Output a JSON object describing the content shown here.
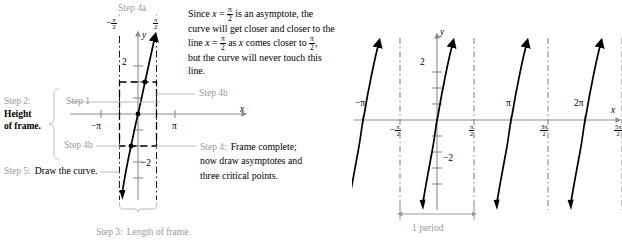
{
  "figure": {
    "kind": "tangent-graphing-steps",
    "colors": {
      "step_label_grey": "#9a9a9a",
      "curve_black": "#000000",
      "axis_grey": "#8c8c8c",
      "frame_dashed": "#000000"
    }
  },
  "steps": {
    "step1": "Step 1",
    "step2_line1": "Step 2:",
    "step2_line2": "Height",
    "step2_line3": "of frame.",
    "step3": "Step 3:",
    "step3_text": "Length of frame.",
    "step4a": "Step 4a",
    "step4b": "Step 4b",
    "step4b_lower": "Step 4b",
    "step4": "Step 4:",
    "step4_text_line1": "Frame complete;",
    "step4_text_line2": "now draw asymptotes and",
    "step4_text_line3": "three critical points.",
    "step5": "Step 5:",
    "step5_text": "Draw the curve."
  },
  "note": {
    "line1_a": "Since ",
    "line1_b": "x",
    "line1_c": " = ",
    "line1_frac": "pi/2",
    "line1_d": " is an asymptote, the",
    "line2": "curve will get closer and closer to the",
    "line3_a": "line ",
    "line3_b": "x",
    "line3_c": " = ",
    "line3_frac": "pi/2",
    "line3_d": " as ",
    "line3_e": "x",
    "line3_f": " comes closer to ",
    "line3_frac2": "pi/2",
    "line3_g": ",",
    "line4": "but the curve will never touch this",
    "line5": "line."
  },
  "left_graph": {
    "axis_x_label": "x",
    "axis_y_label": "y",
    "y_tick_label": "2",
    "y_tick_neg_label": "−2",
    "x_tick_neg_pi": "−π",
    "x_tick_pi": "π",
    "asymptote_left_label": "-pi/2",
    "asymptote_right_label": "pi/2",
    "critical_points": [
      {
        "x": -0.7853981634,
        "y": -2
      },
      {
        "x": 0,
        "y": 0
      },
      {
        "x": 0.7853981634,
        "y": 2
      }
    ],
    "frame": {
      "x_from": -1.5707963268,
      "x_to": 1.5707963268,
      "y_from": -2,
      "y_to": 2
    },
    "xlim": [
      -3.6,
      3.6
    ],
    "ylim": [
      -3.3,
      3.3
    ]
  },
  "right_graph": {
    "axis_x_label": "x",
    "axis_y_label": "y",
    "y_tick_label": "2",
    "y_tick_neg_label": "−2",
    "x_labels_above": [
      "−π",
      "π",
      "2π",
      "3π"
    ],
    "x_labels_below": [
      "-pi/2",
      "pi/2",
      "3pi/2",
      "5pi/2"
    ],
    "period_label": "1 period",
    "branches": 5,
    "asymptotes": [
      "-3pi/2",
      "-pi/2",
      "pi/2",
      "3pi/2",
      "5pi/2",
      "7pi/2"
    ],
    "xlim": [
      -4.3,
      11.6
    ],
    "ylim": [
      -3.3,
      3.3
    ]
  }
}
